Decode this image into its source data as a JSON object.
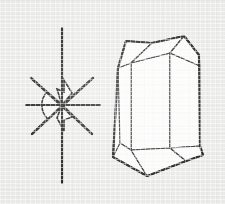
{
  "figure": {
    "background_color": "#e9e9e7",
    "ink_color": "#1c1c1c",
    "facet_fill_color": "#fbfbfa",
    "canvas": {
      "width": 225,
      "height": 204
    },
    "caption": "",
    "labels": []
  },
  "left_diagram": {
    "name": "crystallographic-axes-star",
    "description": "Eight-rayed axial cross with shaded angle wedges at the origin",
    "origin": {
      "x": 62,
      "y": 105
    },
    "rays": [
      {
        "name": "vertical-axis-up",
        "x1": 62,
        "y1": 28,
        "x2": 62,
        "y2": 105
      },
      {
        "name": "vertical-axis-down",
        "x1": 62,
        "y1": 105,
        "x2": 62,
        "y2": 183
      },
      {
        "name": "horizontal-axis-left",
        "x1": 26,
        "y1": 105,
        "x2": 62,
        "y2": 105
      },
      {
        "name": "horizontal-axis-right",
        "x1": 62,
        "y1": 105,
        "x2": 100,
        "y2": 105
      },
      {
        "name": "diagonal-upper-left",
        "x1": 31,
        "y1": 78,
        "x2": 62,
        "y2": 105
      },
      {
        "name": "diagonal-lower-right",
        "x1": 62,
        "y1": 105,
        "x2": 92,
        "y2": 134
      },
      {
        "name": "diagonal-upper-right",
        "x1": 93,
        "y1": 78,
        "x2": 62,
        "y2": 105
      },
      {
        "name": "diagonal-lower-left",
        "x1": 62,
        "y1": 105,
        "x2": 32,
        "y2": 134
      }
    ],
    "angle_markers": [
      {
        "name": "left-arc-wedge",
        "type": "arc",
        "note": "rounded shaded lune on the left of the origin"
      },
      {
        "name": "upper-bowtie",
        "type": "wedge",
        "note": "angular flag above the origin"
      },
      {
        "name": "lower-bowtie",
        "type": "wedge",
        "note": "angular flag below the origin"
      }
    ]
  },
  "right_diagram": {
    "name": "crystal-habit-prism",
    "description": "Prismatic crystal with pyramidal terminations, drawn in outline with shaded faces",
    "faces": [
      {
        "name": "front-prism-face",
        "points": "131,63 170,53 170,148 131,150"
      },
      {
        "name": "right-prism-face",
        "points": "170,53 200,66 200,146 170,148"
      },
      {
        "name": "left-prism-face",
        "points": "118,68 131,63 131,150 120,143"
      },
      {
        "name": "top-left-termination",
        "points": "118,68 131,63 152,43 126,41"
      },
      {
        "name": "top-center-termination",
        "points": "131,63 170,53 184,36 152,43"
      },
      {
        "name": "top-right-termination",
        "points": "170,53 200,66 199,55 184,36"
      },
      {
        "name": "bottom-left-termination",
        "points": "120,143 131,150 147,176 113,157"
      },
      {
        "name": "bottom-center-termination",
        "points": "131,150 170,148 186,161 147,176"
      },
      {
        "name": "bottom-right-termination",
        "points": "170,148 200,146 203,155 186,161"
      }
    ],
    "outline": "126,41 152,43 184,36 199,55 200,146 203,155 186,161 147,176 113,157 118,68"
  }
}
